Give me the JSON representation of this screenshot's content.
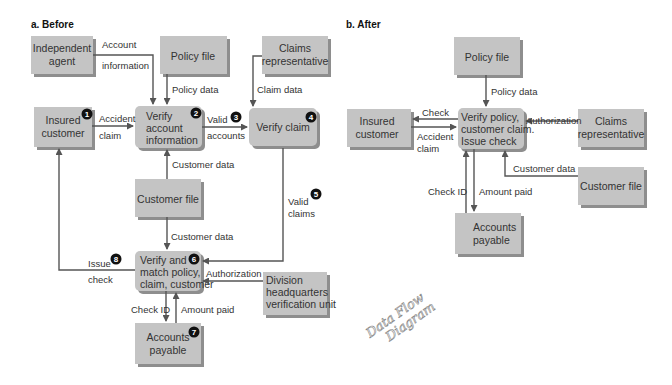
{
  "panels": {
    "before": {
      "title": "a. Before",
      "entities": {
        "independent_agent": [
          "Independent",
          "agent"
        ],
        "policy_file": [
          "Policy file"
        ],
        "claims_rep": [
          "Claims",
          "representative"
        ],
        "insured_customer": [
          "Insured",
          "customer"
        ],
        "verify_account": [
          "Verify",
          "account",
          "information"
        ],
        "verify_claim": [
          "Verify claim"
        ],
        "customer_file": [
          "Customer file"
        ],
        "verify_match": [
          "Verify and",
          "match policy,",
          "claim, customer"
        ],
        "division_hq": [
          "Division",
          "headquarters",
          "verification unit"
        ],
        "accounts_payable": [
          "Accounts",
          "payable"
        ]
      },
      "flows": {
        "account_info": [
          "Account",
          "information"
        ],
        "policy_data": "Policy data",
        "claim_data": "Claim data",
        "accident_claim": [
          "Accident",
          "claim"
        ],
        "valid_accounts": [
          "Valid",
          "accounts"
        ],
        "customer_data_up": "Customer data",
        "customer_data_down": "Customer data",
        "valid_claims": [
          "Valid",
          "claims"
        ],
        "issue_check": [
          "Issue",
          "check"
        ],
        "authorization": "Authorization",
        "check_id": "Check ID",
        "amount_paid": "Amount paid"
      },
      "steps": [
        "1",
        "2",
        "3",
        "4",
        "5",
        "6",
        "7",
        "8"
      ]
    },
    "after": {
      "title": "b. After",
      "entities": {
        "policy_file": [
          "Policy file"
        ],
        "insured_customer": [
          "Insured",
          "customer"
        ],
        "verify_issue": [
          "Verify policy,",
          "customer claim.",
          "Issue check"
        ],
        "claims_rep": [
          "Claims",
          "representative"
        ],
        "customer_file": [
          "Customer file"
        ],
        "accounts_payable": [
          "Accounts",
          "payable"
        ]
      },
      "flows": {
        "policy_data": "Policy data",
        "check": "Check",
        "accident_claim": [
          "Accident",
          "claim"
        ],
        "authorization": "Authorization",
        "customer_data": "Customer data",
        "check_id": "Check ID",
        "amount_paid": "Amount paid"
      }
    }
  },
  "annotation": [
    "Data Flow",
    "Diagram"
  ]
}
